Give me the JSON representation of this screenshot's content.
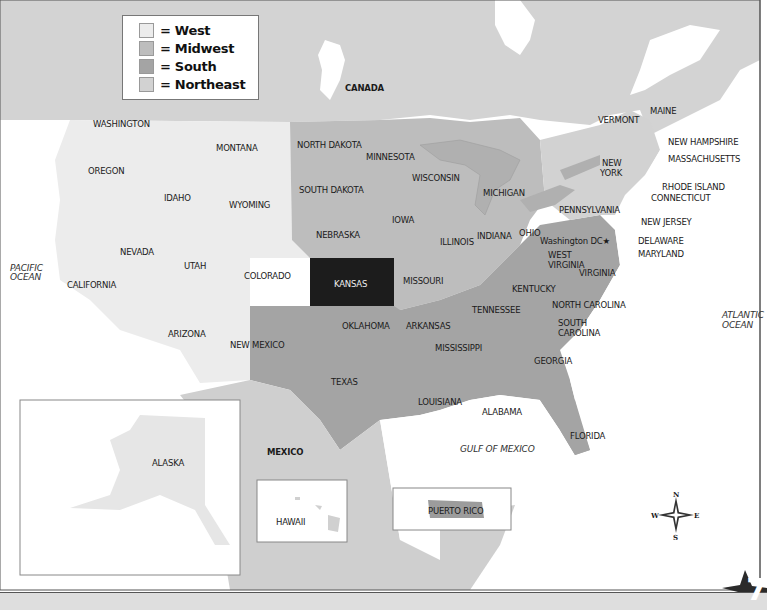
{
  "legend": {
    "items": [
      {
        "label": "= West",
        "color": "#ececec"
      },
      {
        "label": "= Midwest",
        "color": "#b9b9b9"
      },
      {
        "label": "= South",
        "color": "#a2a2a2"
      },
      {
        "label": "= Northeast",
        "color": "#d4d4d4"
      }
    ]
  },
  "colors": {
    "west": "#ececec",
    "midwest": "#bdbdbd",
    "south": "#a4a4a4",
    "northeast": "#d2d2d2",
    "highlight": "#1c1c1c",
    "foreign": "#cfcfcf",
    "water": "#ffffff"
  },
  "highlighted_state": "KANSAS",
  "countries": {
    "canada": "CANADA",
    "mexico": "MEXICO"
  },
  "oceans": {
    "pacific": "PACIFIC OCEAN",
    "atlantic": "ATLANTIC OCEAN",
    "gulf": "GULF OF MEXICO"
  },
  "states": {
    "washington": "WASHINGTON",
    "oregon": "OREGON",
    "california": "CALIFORNIA",
    "idaho": "IDAHO",
    "montana": "MONTANA",
    "wyoming": "WYOMING",
    "nevada": "NEVADA",
    "utah": "UTAH",
    "colorado": "COLORADO",
    "arizona": "ARIZONA",
    "new_mexico": "NEW MEXICO",
    "north_dakota": "NORTH DAKOTA",
    "south_dakota": "SOUTH DAKOTA",
    "nebraska": "NEBRASKA",
    "kansas": "KANSAS",
    "minnesota": "MINNESOTA",
    "iowa": "IOWA",
    "missouri": "MISSOURI",
    "wisconsin": "WISCONSIN",
    "illinois": "ILLINOIS",
    "michigan": "MICHIGAN",
    "indiana": "INDIANA",
    "ohio": "OHIO",
    "oklahoma": "OKLAHOMA",
    "texas": "TEXAS",
    "arkansas": "ARKANSAS",
    "louisiana": "LOUISIANA",
    "mississippi": "MISSISSIPPI",
    "alabama": "ALABAMA",
    "tennessee": "TENNESSEE",
    "kentucky": "KENTUCKY",
    "georgia": "GEORGIA",
    "florida": "FLORIDA",
    "south_carolina_1": "SOUTH",
    "south_carolina_2": "CAROLINA",
    "north_carolina": "NORTH CAROLINA",
    "virginia": "VIRGINIA",
    "west_virginia_1": "WEST",
    "west_virginia_2": "VIRGINIA",
    "maryland": "MARYLAND",
    "delaware": "DELAWARE",
    "washington_dc": "Washington DC★",
    "pennsylvania": "PENNSYLVANIA",
    "new_jersey": "NEW JERSEY",
    "new_york_1": "NEW",
    "new_york_2": "YORK",
    "connecticut": "CONNECTICUT",
    "rhode_island": "RHODE ISLAND",
    "massachusetts": "MASSACHUSETTS",
    "vermont": "VERMONT",
    "new_hampshire": "NEW HAMPSHIRE",
    "maine": "MAINE",
    "alaska": "ALASKA",
    "hawaii": "HAWAII",
    "puerto_rico": "PUERTO RICO"
  },
  "compass": {
    "n": "N",
    "s": "S",
    "e": "E",
    "w": "W"
  },
  "page_number": "7"
}
